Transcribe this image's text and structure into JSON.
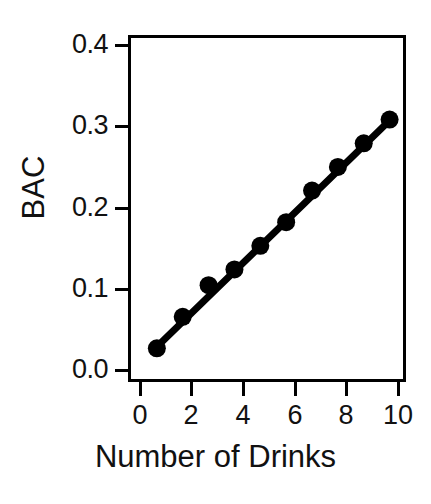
{
  "chart_data": {
    "type": "scatter",
    "title": "",
    "xlabel": "Number of Drinks",
    "ylabel": "BAC",
    "x": [
      1,
      2,
      3,
      4,
      5,
      6,
      7,
      8,
      9,
      10
    ],
    "values": [
      0.03,
      0.07,
      0.11,
      0.13,
      0.16,
      0.19,
      0.23,
      0.26,
      0.29,
      0.32
    ],
    "series": [
      {
        "name": "BAC vs Number of Drinks",
        "values": [
          0.03,
          0.07,
          0.11,
          0.13,
          0.16,
          0.19,
          0.23,
          0.26,
          0.29,
          0.32
        ]
      }
    ],
    "trendline": {
      "type": "linear",
      "x_start": 1,
      "y_start": 0.032,
      "x_end": 10,
      "y_end": 0.319
    },
    "xlim": [
      0,
      10.75
    ],
    "ylim": [
      -0.0165,
      0.4235
    ],
    "xticks": [
      0,
      2,
      4,
      6,
      8,
      10
    ],
    "xtick_labels": [
      "0",
      "2",
      "4",
      "6",
      "8",
      "10"
    ],
    "yticks": [
      0.0,
      0.1,
      0.2,
      0.3,
      0.4
    ],
    "ytick_labels": [
      "0.0",
      "0.1",
      "0.2",
      "0.3",
      "0.4"
    ],
    "grid": false,
    "legend": "none",
    "marker": "filled-circle",
    "colors": {
      "line": "#000000",
      "marker": "#000000",
      "axis": "#000000",
      "background": "#ffffff"
    }
  }
}
